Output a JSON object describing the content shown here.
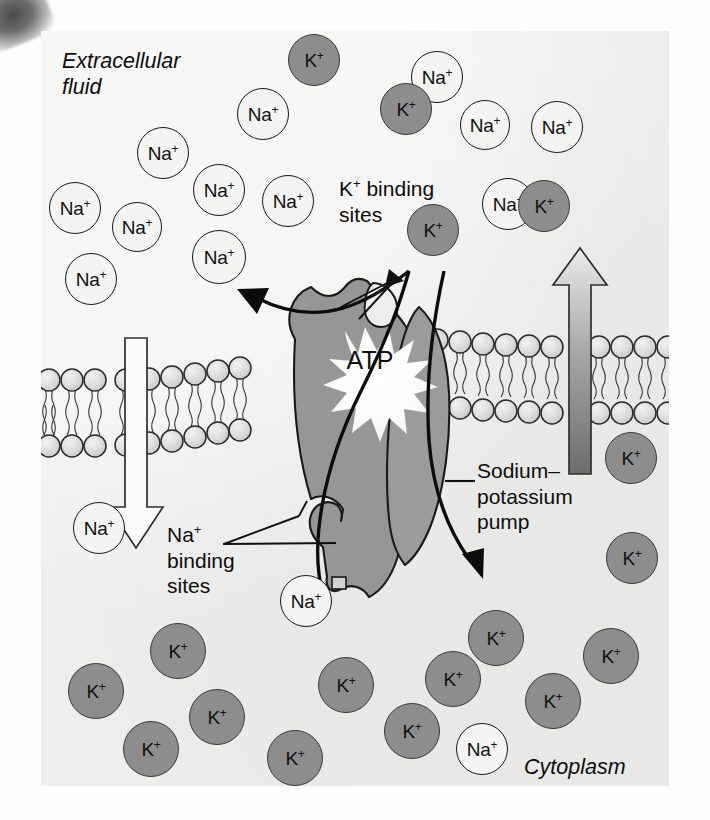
{
  "figure": {
    "title_region": "sodium-potassium pump diagram",
    "labels": {
      "extracellular": "Extracellular\nfluid",
      "extracellular_line1": "Extracellular",
      "extracellular_line2": "fluid",
      "cytoplasm": "Cytoplasm",
      "k_binding_line1": "K",
      "k_binding_line1_sup": "+",
      "k_binding_line1_rest": " binding",
      "k_binding_line2": "sites",
      "na_binding_line1": "Na",
      "na_binding_line1_sup": "+",
      "na_binding_line2": "binding",
      "na_binding_line3": "sites",
      "pump_line1": "Sodium–",
      "pump_line2": "potassium",
      "pump_line3": "pump",
      "atp": "ATP"
    },
    "ion_labels": {
      "sodium": "Na",
      "potassium": "K",
      "charge": "+"
    },
    "colors": {
      "panel_background": "#eeeeec",
      "potassium_fill": "#8d8d8d",
      "sodium_fill": "#f4f4f2",
      "ion_stroke": "#18181a",
      "pump_fill": "#969696",
      "pump_stroke": "#1a1a1a",
      "lipid_head_fill": "#d9d9d7",
      "atp_burst_fill": "#f7f7f5",
      "gradient_arrow_dark": "#6f6f6f",
      "gradient_arrow_light": "#e4e4e2",
      "hollow_arrow_fill": "#fbfbfa",
      "text": "#0d0d0d"
    },
    "extracellular_sodium_ions": [
      {
        "x": 34,
        "y": 177,
        "r": 26
      },
      {
        "x": 96,
        "y": 196,
        "r": 25
      },
      {
        "x": 122,
        "y": 122,
        "r": 26
      },
      {
        "x": 50,
        "y": 248,
        "r": 26
      },
      {
        "x": 178,
        "y": 159,
        "r": 26
      },
      {
        "x": 178,
        "y": 226,
        "r": 27
      },
      {
        "x": 222,
        "y": 83,
        "r": 26
      },
      {
        "x": 247,
        "y": 170,
        "r": 26
      },
      {
        "x": 396,
        "y": 46,
        "r": 26
      },
      {
        "x": 467,
        "y": 173,
        "r": 26
      },
      {
        "x": 516,
        "y": 96,
        "r": 26
      },
      {
        "x": 445,
        "y": 95,
        "r": 25
      }
    ],
    "extracellular_potassium_ions": [
      {
        "x": 273,
        "y": 29,
        "r": 26
      },
      {
        "x": 365,
        "y": 78,
        "r": 26
      },
      {
        "x": 392,
        "y": 199,
        "r": 26
      },
      {
        "x": 503,
        "y": 175,
        "r": 26
      }
    ],
    "cytoplasm_potassium_ions": [
      {
        "x": 55,
        "y": 660,
        "r": 28
      },
      {
        "x": 137,
        "y": 620,
        "r": 28
      },
      {
        "x": 176,
        "y": 686,
        "r": 28
      },
      {
        "x": 110,
        "y": 718,
        "r": 28
      },
      {
        "x": 254,
        "y": 727,
        "r": 28
      },
      {
        "x": 305,
        "y": 654,
        "r": 28
      },
      {
        "x": 371,
        "y": 700,
        "r": 28
      },
      {
        "x": 412,
        "y": 648,
        "r": 28
      },
      {
        "x": 455,
        "y": 607,
        "r": 28
      },
      {
        "x": 512,
        "y": 670,
        "r": 28
      },
      {
        "x": 570,
        "y": 625,
        "r": 28
      },
      {
        "x": 590,
        "y": 427,
        "r": 26
      },
      {
        "x": 591,
        "y": 527,
        "r": 26
      }
    ],
    "cytoplasm_sodium_ions": [
      {
        "x": 265,
        "y": 570,
        "r": 26
      },
      {
        "x": 441,
        "y": 718,
        "r": 26
      },
      {
        "x": 58,
        "y": 497,
        "r": 26
      }
    ],
    "flow_arrows": [
      {
        "name": "sodium-efflux-arrow",
        "direction": "up-left",
        "note": "Na+ pumped out"
      },
      {
        "name": "potassium-influx-arrow",
        "direction": "down-right",
        "note": "K+ pumped in"
      },
      {
        "name": "sodium-gradient-arrow",
        "direction": "down",
        "note": "hollow arrow, inward Na+ gradient"
      },
      {
        "name": "potassium-gradient-arrow",
        "direction": "up",
        "note": "gradient-filled arrow, outward K+ gradient"
      }
    ]
  }
}
